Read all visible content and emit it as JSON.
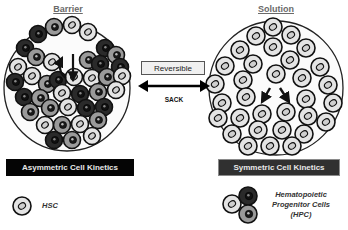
{
  "titles": {
    "left": "Barrier",
    "right": "Solution"
  },
  "center": {
    "reversible_label": "Reversible",
    "arrow_label": "SACK"
  },
  "bars": {
    "left": "Asymmetric Cell Kinetics",
    "right": "Symmetric Cell Kinetics"
  },
  "legend": {
    "hsc_label": "HSC",
    "hpc_lines": [
      "Hematopoietic",
      "Progenitor Cells",
      "(HPC)"
    ]
  },
  "colors": {
    "hsc_fill": "#e4e4e4",
    "hpc_mid_fill": "#9a9a9a",
    "hpc_dark_fill": "#2a2a2a",
    "outline": "#111111",
    "container_outline": "#222222"
  },
  "containers": [
    {
      "name": "barrier-container",
      "cx": 67,
      "cy": 88,
      "r": 63
    },
    {
      "name": "solution-container",
      "cx": 276,
      "cy": 88,
      "r": 67
    }
  ],
  "barrier_cells": [
    [
      38,
      34,
      "d"
    ],
    [
      54,
      27,
      "m"
    ],
    [
      72,
      25,
      "h"
    ],
    [
      88,
      32,
      "h"
    ],
    [
      25,
      48,
      "d"
    ],
    [
      105,
      48,
      "d"
    ],
    [
      116,
      55,
      "m"
    ],
    [
      120,
      67,
      "d"
    ],
    [
      18,
      67,
      "h"
    ],
    [
      36,
      57,
      "m"
    ],
    [
      52,
      62,
      "h"
    ],
    [
      88,
      60,
      "m"
    ],
    [
      100,
      64,
      "d"
    ],
    [
      15,
      82,
      "d"
    ],
    [
      32,
      76,
      "h"
    ],
    [
      47,
      84,
      "m"
    ],
    [
      58,
      80,
      "d"
    ],
    [
      74,
      77,
      "h"
    ],
    [
      92,
      78,
      "h"
    ],
    [
      107,
      77,
      "m"
    ],
    [
      122,
      76,
      "h"
    ],
    [
      24,
      97,
      "d"
    ],
    [
      40,
      98,
      "m"
    ],
    [
      62,
      93,
      "h"
    ],
    [
      80,
      94,
      "d"
    ],
    [
      98,
      92,
      "m"
    ],
    [
      116,
      90,
      "h"
    ],
    [
      30,
      112,
      "m"
    ],
    [
      50,
      108,
      "m"
    ],
    [
      68,
      107,
      "h"
    ],
    [
      86,
      108,
      "d"
    ],
    [
      104,
      107,
      "d"
    ],
    [
      45,
      125,
      "h"
    ],
    [
      62,
      125,
      "m"
    ],
    [
      80,
      124,
      "h"
    ],
    [
      98,
      120,
      "m"
    ],
    [
      54,
      140,
      "d"
    ],
    [
      72,
      140,
      "m"
    ],
    [
      92,
      136,
      "h"
    ]
  ],
  "solution_cells": [
    [
      273,
      27,
      "h"
    ],
    [
      256,
      36,
      "h"
    ],
    [
      291,
      35,
      "h"
    ],
    [
      240,
      50,
      "h"
    ],
    [
      273,
      47,
      "h"
    ],
    [
      306,
      48,
      "h"
    ],
    [
      225,
      66,
      "h"
    ],
    [
      253,
      64,
      "h"
    ],
    [
      290,
      60,
      "h"
    ],
    [
      320,
      67,
      "h"
    ],
    [
      215,
      84,
      "h"
    ],
    [
      243,
      80,
      "h"
    ],
    [
      276,
      74,
      "h"
    ],
    [
      302,
      78,
      "h"
    ],
    [
      328,
      85,
      "h"
    ],
    [
      222,
      103,
      "h"
    ],
    [
      246,
      97,
      "h"
    ],
    [
      306,
      99,
      "h"
    ],
    [
      333,
      103,
      "h"
    ],
    [
      218,
      118,
      "h"
    ],
    [
      240,
      118,
      "h"
    ],
    [
      262,
      114,
      "h"
    ],
    [
      286,
      112,
      "h"
    ],
    [
      308,
      116,
      "h"
    ],
    [
      326,
      122,
      "h"
    ],
    [
      232,
      134,
      "h"
    ],
    [
      258,
      130,
      "h"
    ],
    [
      282,
      130,
      "h"
    ],
    [
      304,
      134,
      "h"
    ],
    [
      248,
      146,
      "h"
    ],
    [
      270,
      146,
      "h"
    ],
    [
      292,
      146,
      "h"
    ]
  ]
}
